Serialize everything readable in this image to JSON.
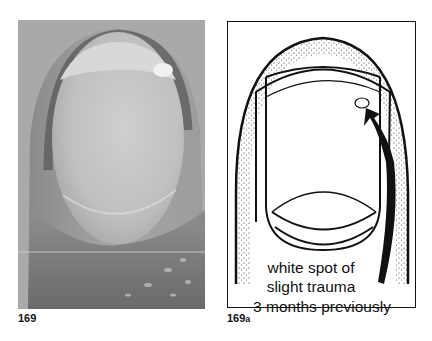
{
  "figures": [
    {
      "id": "photo",
      "label": "169",
      "type": "photograph",
      "description": "grayscale clinical photograph of a fingernail showing a white spot near the distal edge"
    },
    {
      "id": "drawing",
      "label_number": "169",
      "label_suffix": "a",
      "type": "line-drawing",
      "annotation": {
        "line1": "white spot of",
        "line2": "slight trauma",
        "line3": "3 months previously"
      },
      "arrow": "arrow pointing to white spot"
    }
  ],
  "colors": {
    "photo_background": "#a4a4a4",
    "photo_nail": "#c6c6c6",
    "photo_shadow": "#5c5c5c",
    "ink": "#111111"
  }
}
